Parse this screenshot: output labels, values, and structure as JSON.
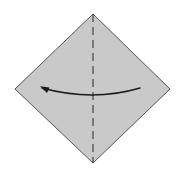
{
  "canvas": {
    "width": 178,
    "height": 173,
    "background_color": "#ffffff"
  },
  "diagram": {
    "shape": {
      "name": "paper-diamond",
      "kind": "square-rotated-45",
      "fill_color": "#c9c9c9",
      "stroke_color": "#555555",
      "stroke_width": 1,
      "points": "93,14 170,89 93,163 15,89",
      "vertices": {
        "top": [
          93,
          14
        ],
        "right": [
          170,
          89
        ],
        "bottom": [
          93,
          163
        ],
        "left": [
          15,
          89
        ]
      }
    },
    "fold_line": {
      "name": "vertical-dashed-fold-line",
      "kind": "dashed",
      "stroke_color": "#444444",
      "stroke_width": 1.2,
      "dash_pattern": "8 5",
      "x": 93,
      "y_start": 14,
      "y_end": 163
    },
    "arrow": {
      "name": "fold-direction-arrow",
      "direction": "right-to-left",
      "stroke_color": "#1a1a1a",
      "stroke_width": 1.4,
      "path": "M 140 88 Q 93 102 42 88",
      "start_point": [
        140,
        88
      ],
      "control_point": [
        93,
        102
      ],
      "end_point": [
        42,
        88
      ],
      "head": {
        "name": "arrowhead",
        "kind": "solid-triangle",
        "points": "40,86.2 49.5,87.6 47,93",
        "fill_color": "#1a1a1a"
      }
    }
  }
}
